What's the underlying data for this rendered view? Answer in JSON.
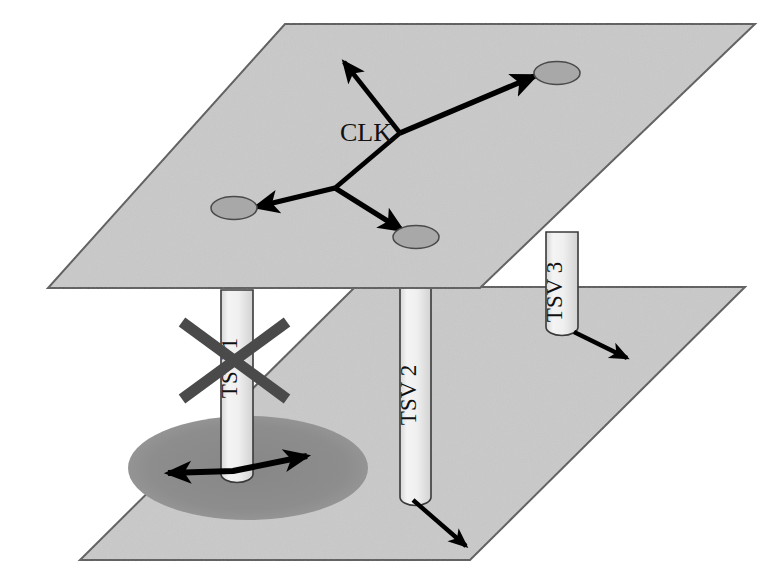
{
  "figure": {
    "kind": "technical-diagram"
  },
  "colors": {
    "die_plane_fill": "#c9c9c9",
    "die_plane_stroke": "#5a5a5a",
    "tsv_fill": "#ececec",
    "tsv_stroke": "#3a3a3a",
    "keepout_fill": "#8f8f8f",
    "sink_fill": "#a8a8a8",
    "sink_stroke": "#4a4a4a",
    "wire_stroke": "#000000",
    "cross_out_stroke": "#4a4a4a",
    "background": "#ffffff",
    "label_color": "#111111"
  },
  "top_die": {
    "name": "upper-die-plane",
    "clock_source_label": "CLK",
    "sinks": [
      {
        "id": "sink-top-right",
        "label": ""
      },
      {
        "id": "sink-mid-left",
        "label": ""
      },
      {
        "id": "sink-bottom-center",
        "label": ""
      }
    ],
    "branch_count": 4
  },
  "bottom_die": {
    "name": "lower-die-plane",
    "keepout_zone_label": ""
  },
  "tsvs": [
    {
      "id": "tsv-1",
      "label": "TSV 1",
      "crossed_out": true,
      "has_keepout_zone": true,
      "has_bidirectional_arrow": true
    },
    {
      "id": "tsv-2",
      "label": "TSV 2",
      "crossed_out": false,
      "has_keepout_zone": false,
      "has_bidirectional_arrow": false
    },
    {
      "id": "tsv-3",
      "label": "TSV 3",
      "crossed_out": false,
      "has_keepout_zone": false,
      "has_bidirectional_arrow": false
    }
  ],
  "annotations": {
    "cross_out_mark": "X",
    "tsv1_note": "",
    "arrow_count_top_die": 4,
    "arrow_count_bottom_die": 4
  }
}
